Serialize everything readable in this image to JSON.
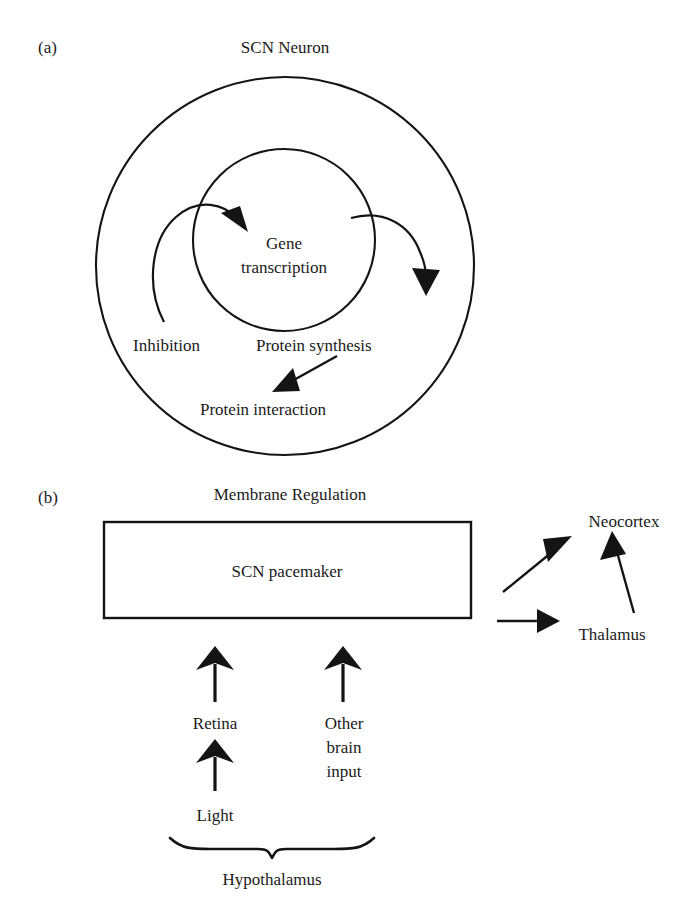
{
  "figure": {
    "background_color": "#ffffff",
    "ink_color": "#141414"
  },
  "panel_a": {
    "panel_label": "(a)",
    "title": "SCN Neuron",
    "outer_circle_name": "scn-neuron-membrane",
    "inner_circle_name": "nucleus",
    "nodes": [
      {
        "id": "gene-transcription",
        "label_line1": "Gene",
        "label_line2": "transcription"
      },
      {
        "id": "inhibition",
        "label": "Inhibition"
      },
      {
        "id": "protein-synthesis",
        "label": "Protein synthesis"
      },
      {
        "id": "protein-interaction",
        "label": "Protein interaction"
      }
    ],
    "arrows": [
      {
        "id": "inhibition-to-gene-transcription",
        "style": "curved",
        "from": "inhibition",
        "to": "gene-transcription"
      },
      {
        "id": "gene-transcription-to-protein-synthesis",
        "style": "curved",
        "from": "gene-transcription",
        "to": "protein-synthesis"
      },
      {
        "id": "protein-synthesis-to-protein-interaction",
        "style": "straight",
        "from": "protein-synthesis",
        "to": "protein-interaction"
      }
    ]
  },
  "panel_b": {
    "panel_label": "(b)",
    "title": "Membrane Regulation",
    "pacemaker_box_label": "SCN pacemaker",
    "nodes": [
      {
        "id": "neocortex",
        "label": "Neocortex"
      },
      {
        "id": "thalamus",
        "label": "Thalamus"
      },
      {
        "id": "retina",
        "label": "Retina"
      },
      {
        "id": "other-brain-input",
        "label_line1": "Other",
        "label_line2": "brain",
        "label_line3": "input"
      },
      {
        "id": "light",
        "label": "Light"
      },
      {
        "id": "hypothalamus",
        "label": "Hypothalamus"
      }
    ],
    "arrows": [
      {
        "id": "pacemaker-to-neocortex",
        "style": "straight-diagonal"
      },
      {
        "id": "pacemaker-to-thalamus",
        "style": "straight-horizontal"
      },
      {
        "id": "thalamus-to-neocortex",
        "style": "straight-vertical"
      },
      {
        "id": "retina-to-pacemaker",
        "style": "straight-vertical"
      },
      {
        "id": "other-brain-input-to-pacemaker",
        "style": "straight-vertical"
      },
      {
        "id": "light-to-retina",
        "style": "straight-vertical"
      }
    ],
    "brace": {
      "id": "hypothalamus-brace",
      "direction": "down"
    }
  }
}
